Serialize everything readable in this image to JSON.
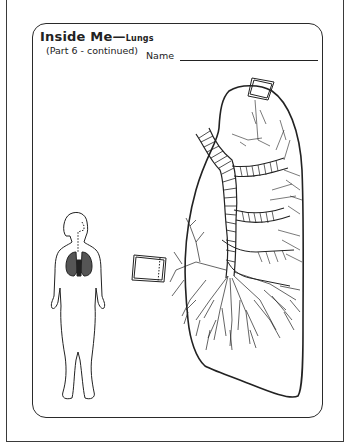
{
  "worksheet": {
    "title": "Inside Me",
    "title_dash": "—",
    "title_topic": "Lungs",
    "subtitle": "(Part 6 - continued)",
    "name_label": "Name",
    "name_value": ""
  },
  "illustrations": {
    "child_figure": "child-silhouette-with-lungs-icon",
    "lung_diagram": "lung-bronchial-tree-diagram",
    "label_boxes": [
      "top-label-box",
      "left-label-box"
    ]
  },
  "colors": {
    "ink": "#222222",
    "paper": "#ffffff"
  }
}
